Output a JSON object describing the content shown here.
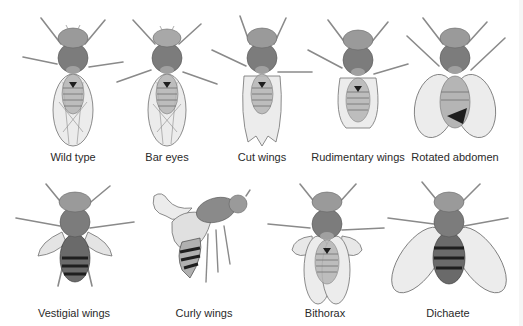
{
  "figure": {
    "colors": {
      "background": "#ffffff",
      "head": "#9a9a9a",
      "thorax": "#7c7c7c",
      "abdomen_light": "#b5b5b5",
      "abdomen_dark": "#1e1e1e",
      "wing_fill": "#ececec",
      "wing_vein": "#707070",
      "leg": "#8a8a8a",
      "label_text": "#2a2a2a"
    },
    "rows": [
      {
        "panels": [
          {
            "label": "Wild type",
            "phenotype": "wild-type",
            "cx": 73,
            "label_y": 151
          },
          {
            "label": "Bar eyes",
            "phenotype": "bar-eyes",
            "cx": 167,
            "label_y": 151
          },
          {
            "label": "Cut wings",
            "phenotype": "cut-wings",
            "cx": 262,
            "label_y": 151
          },
          {
            "label": "Rudimentary wings",
            "phenotype": "rudimentary-wings",
            "cx": 358,
            "label_y": 151
          },
          {
            "label": "Rotated abdomen",
            "phenotype": "rotated-abdomen",
            "cx": 455,
            "label_y": 151
          }
        ]
      },
      {
        "panels": [
          {
            "label": "Vestigial wings",
            "phenotype": "vestigial-wings",
            "cx": 74,
            "label_y": 307
          },
          {
            "label": "Curly wings",
            "phenotype": "curly-wings",
            "cx": 204,
            "label_y": 307
          },
          {
            "label": "Bithorax",
            "phenotype": "bithorax",
            "cx": 325,
            "label_y": 307
          },
          {
            "label": "Dichaete",
            "phenotype": "dichaete",
            "cx": 448,
            "label_y": 307
          }
        ]
      }
    ]
  }
}
